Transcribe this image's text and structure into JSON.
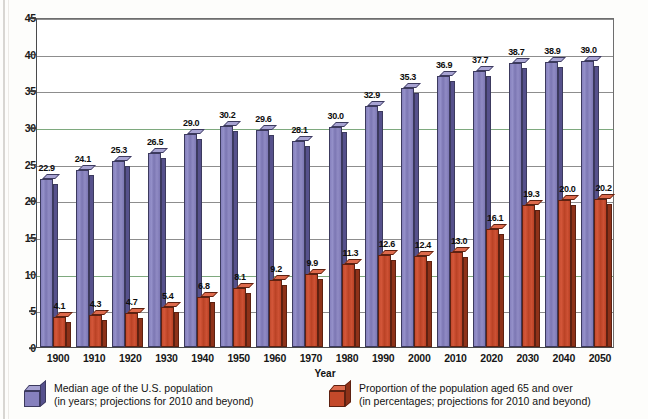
{
  "chart_data": {
    "type": "bar",
    "title": "",
    "xlabel": "Year",
    "ylabel": "",
    "ylim": [
      0,
      45
    ],
    "ytick_step": 5,
    "yticks": [
      "45",
      "40",
      "35",
      "30",
      "25",
      "20",
      "15",
      "10",
      "5",
      "0"
    ],
    "grid": true,
    "legend_position": "bottom",
    "categories": [
      "1900",
      "1910",
      "1920",
      "1930",
      "1940",
      "1950",
      "1960",
      "1970",
      "1980",
      "1990",
      "2000",
      "2010",
      "2020",
      "2030",
      "2040",
      "2050"
    ],
    "series": [
      {
        "name": "Median age of the U.S. population",
        "name_line2": "(in years; projections for 2010 and beyond)",
        "color": "#8681bd",
        "values": [
          22.9,
          24.1,
          25.3,
          26.5,
          29.0,
          30.2,
          29.6,
          28.1,
          30.0,
          32.9,
          35.3,
          36.9,
          37.7,
          38.7,
          38.9,
          39.0
        ],
        "labels": [
          "22.9",
          "24.1",
          "25.3",
          "26.5",
          "29.0",
          "30.2",
          "29.6",
          "28.1",
          "30.0",
          "32.9",
          "35.3",
          "36.9",
          "37.7",
          "38.7",
          "38.9",
          "39.0"
        ]
      },
      {
        "name": "Proportion of the population aged 65 and over",
        "name_line2": "(in percentages; projections for 2010 and beyond)",
        "color": "#c4492a",
        "values": [
          4.1,
          4.3,
          4.7,
          5.4,
          6.8,
          8.1,
          9.2,
          9.9,
          11.3,
          12.6,
          12.4,
          13.0,
          16.1,
          19.3,
          20.0,
          20.2
        ],
        "labels": [
          "4.1",
          "4.3",
          "4.7",
          "5.4",
          "6.8",
          "8.1",
          "9.2",
          "9.9",
          "11.3",
          "12.6",
          "12.4",
          "13.0",
          "16.1",
          "19.3",
          "20.0",
          "20.2"
        ]
      }
    ]
  },
  "axis": {
    "x_title": "Year"
  },
  "legend": {
    "items": [
      {
        "swatch": "purple-cube-icon",
        "line1": "Median age of the U.S. population",
        "line2": "(in years; projections for 2010 and beyond)"
      },
      {
        "swatch": "red-cube-icon",
        "line1": "Proportion of the population aged 65 and over",
        "line2": "(in percentages; projections for 2010 and beyond)"
      }
    ]
  }
}
